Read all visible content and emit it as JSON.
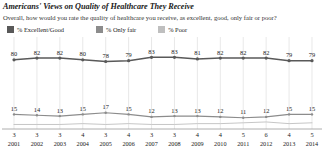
{
  "title": "Americans' Views on Quality of Healthcare They Receive",
  "subtitle": "Overall, how would you rate the quality of healthcare you receive, as excellent, good, only fair or poor?",
  "legend": [
    {
      "label": "% Excellent/Good",
      "color": "#595959",
      "icon": "legend-swatch-icon"
    },
    {
      "label": "% Only fair",
      "color": "#8c8c8c",
      "icon": "legend-swatch-icon"
    },
    {
      "label": "% Poor",
      "color": "#bfbfbf",
      "icon": "legend-swatch-icon"
    }
  ],
  "chart_data": {
    "type": "line",
    "title": "Americans' Views on Quality of Healthcare They Receive",
    "subtitle": "Overall, how would you rate the quality of healthcare you receive, as excellent, good, only fair or poor?",
    "xlabel": "",
    "ylabel": "",
    "ylim": [
      0,
      100
    ],
    "grid": "vertical",
    "legend_position": "top-left",
    "categories": [
      "2001",
      "2002",
      "2003",
      "2004",
      "2005",
      "2006",
      "2007",
      "2008",
      "2009",
      "2010",
      "2011",
      "2012",
      "2013",
      "2014"
    ],
    "series": [
      {
        "name": "% Excellent/Good",
        "color": "#595959",
        "values": [
          80,
          82,
          82,
          80,
          78,
          79,
          83,
          83,
          81,
          82,
          82,
          82,
          79,
          79
        ]
      },
      {
        "name": "% Only fair",
        "color": "#8c8c8c",
        "values": [
          15,
          14,
          13,
          15,
          17,
          15,
          12,
          13,
          13,
          12,
          11,
          12,
          15,
          15
        ]
      },
      {
        "name": "% Poor",
        "color": "#bfbfbf",
        "values": [
          3,
          3,
          3,
          4,
          3,
          4,
          3,
          3,
          4,
          4,
          5,
          6,
          4,
          5
        ]
      }
    ]
  }
}
